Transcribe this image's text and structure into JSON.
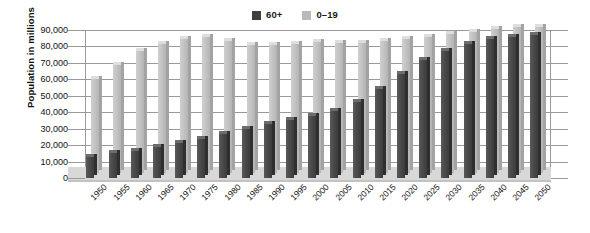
{
  "chart_data": {
    "type": "bar",
    "title": "",
    "subtitle": "",
    "xlabel": "",
    "ylabel": "Population in millions",
    "ylim": [
      0,
      90000
    ],
    "ytick_step": 10000,
    "yticks": [
      "0",
      "10,000",
      "20,000",
      "30,000",
      "40,000",
      "50,000",
      "60,000",
      "70,000",
      "80,000",
      "90,000"
    ],
    "grid": true,
    "legend_position": "top-center",
    "categories": [
      "1950",
      "1955",
      "1960",
      "1965",
      "1970",
      "1975",
      "1980",
      "1985",
      "1990",
      "1995",
      "2000",
      "2005",
      "2010",
      "2015",
      "2020",
      "2025",
      "2030",
      "2035",
      "2040",
      "2045",
      "2050"
    ],
    "series": [
      {
        "name": "60+",
        "color": "#3f3f3f",
        "values": [
          13000,
          15000,
          16500,
          19000,
          21500,
          24000,
          26500,
          30000,
          33000,
          35500,
          37500,
          41000,
          46500,
          54000,
          63000,
          71500,
          77500,
          81500,
          84500,
          86000,
          87000
        ]
      },
      {
        "name": "0–19",
        "color": "#b9b9b9",
        "values": [
          57000,
          65500,
          74000,
          78500,
          81500,
          82500,
          80500,
          78000,
          78000,
          78500,
          79500,
          79000,
          79000,
          80000,
          81500,
          83000,
          84500,
          86000,
          87500,
          88500,
          89000
        ]
      }
    ]
  },
  "legend": {
    "entries": [
      {
        "label": "60+",
        "swatch": "dark-square-icon"
      },
      {
        "label": "0–19",
        "swatch": "light-square-icon"
      }
    ]
  }
}
